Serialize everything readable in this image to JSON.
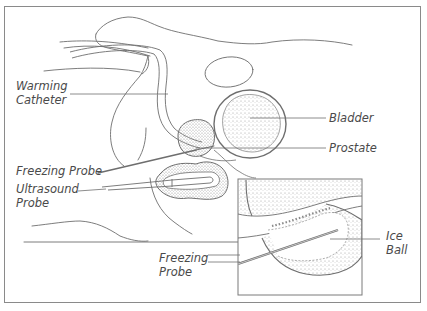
{
  "diagram": {
    "type": "anatomical-illustration",
    "labels": {
      "warming_catheter": [
        "Warming",
        "Catheter"
      ],
      "bladder": "Bladder",
      "prostate": "Prostate",
      "freezing_probe_main": "Freezing Probe",
      "ultrasound_probe": [
        "Ultrasound",
        "Probe"
      ],
      "freezing_probe_inset": [
        "Freezing",
        "Probe"
      ],
      "ice_ball": [
        "Ice",
        "Ball"
      ]
    },
    "colors": {
      "line": "#6e6e6e",
      "frame": "#8a8a8a",
      "stipple": "#9a9a9a",
      "text": "#4a4a4a",
      "background": "#ffffff"
    }
  }
}
